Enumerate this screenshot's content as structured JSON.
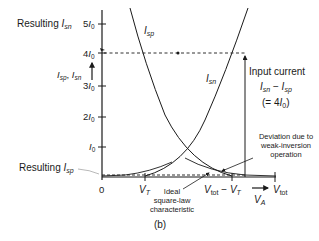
{
  "figure": {
    "caption": "(b)",
    "y_axis": {
      "label_main": "I",
      "label_sub1": "sp",
      "label_sep": ", ",
      "label_sub2": "sn",
      "ticks": [
        {
          "coef": "5",
          "var": "I",
          "sub": "0"
        },
        {
          "coef": "4",
          "var": "I",
          "sub": "0"
        },
        {
          "coef": "3",
          "var": "I",
          "sub": "0"
        },
        {
          "coef": "2",
          "var": "I",
          "sub": "0"
        },
        {
          "coef": "",
          "var": "I",
          "sub": "0"
        },
        {
          "coef": "0",
          "var": "",
          "sub": ""
        }
      ]
    },
    "x_axis": {
      "label_main": "V",
      "label_sub": "A",
      "ticks": [
        {
          "main": "V",
          "sub": "T"
        },
        {
          "main": "V",
          "sub": "tot",
          "minus": " − ",
          "main2": "V",
          "sub2": "T"
        },
        {
          "main": "V",
          "sub": "tot"
        }
      ]
    },
    "annotations": {
      "resulting_isn": {
        "prefix": "Resulting ",
        "main": "I",
        "sub": "sn"
      },
      "resulting_isp": {
        "prefix": "Resulting ",
        "main": "I",
        "sub": "sp"
      },
      "curve_isp": {
        "main": "I",
        "sub": "sp"
      },
      "curve_isn": {
        "main": "I",
        "sub": "sn"
      },
      "input_current": {
        "title": "Input current",
        "expr_a": "I",
        "expr_a_sub": "sn",
        "expr_op": " − ",
        "expr_b": "I",
        "expr_b_sub": "sp",
        "eq_prefix": "(= 4",
        "eq_var": "I",
        "eq_sub": "0",
        "eq_suffix": ")"
      },
      "deviation": [
        "Deviation due to",
        "weak-inversion",
        "operation"
      ],
      "ideal": [
        "Ideal",
        "square-law",
        "characteristic"
      ]
    },
    "colors": {
      "ink": "#1a1a1a",
      "background": "#ffffff"
    }
  }
}
